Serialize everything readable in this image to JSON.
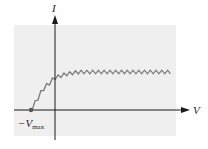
{
  "diagram": {
    "axes": {
      "x_label": "V",
      "y_label": "I"
    },
    "marker": {
      "label_main": "−V",
      "label_sub": "max"
    },
    "colors": {
      "background_panel": "#efefef",
      "axis": "#1a1a1a",
      "curve": "#7a7a7a",
      "marker": "#555555"
    }
  },
  "chart_data": {
    "type": "line",
    "title": "",
    "xlabel": "V",
    "ylabel": "I",
    "annotations": [
      "−Vmax"
    ],
    "series": [
      {
        "name": "photocurrent",
        "points_normalized": {
          "note": "x: -1 = -Vmax, 0 = origin; y: fraction of saturation current",
          "x": [
            -1.0,
            -0.5,
            0.0,
            0.5,
            1.0,
            2.0,
            3.0,
            4.0,
            4.9
          ],
          "y": [
            0.0,
            0.55,
            0.85,
            0.95,
            1.0,
            1.0,
            1.0,
            1.0,
            1.0
          ]
        }
      }
    ],
    "grid": false,
    "legend": "none"
  }
}
